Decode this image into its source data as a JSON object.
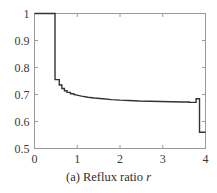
{
  "caption": {
    "prefix": "(a) Reflux ratio",
    "variable": "r"
  },
  "chart_data": {
    "type": "line",
    "title": "",
    "subtitle": "",
    "xlabel": "Reflux ratio r",
    "ylabel": "",
    "xlim": [
      0,
      4
    ],
    "ylim": [
      0.5,
      1.0
    ],
    "grid": false,
    "legend": false,
    "xticks": [
      0,
      1,
      2,
      3,
      4
    ],
    "xtick_labels": [
      "0",
      "1",
      "2",
      "3",
      "4"
    ],
    "yticks": [
      0.5,
      0.6,
      0.7,
      0.8,
      0.9,
      1.0
    ],
    "ytick_labels": [
      "0.5",
      "0.6",
      "0.7",
      "0.8",
      "0.9",
      "1"
    ],
    "line_color": "#333333",
    "frame_color": "#9a9a9a",
    "series": [
      {
        "name": "objective",
        "step_style": "post",
        "x": [
          0.0,
          0.48,
          0.48,
          0.58,
          0.58,
          0.64,
          0.64,
          0.7,
          0.7,
          0.76,
          0.76,
          0.84,
          0.84,
          0.92,
          0.92,
          1.02,
          1.1,
          1.25,
          1.4,
          1.6,
          1.8,
          2.0,
          2.2,
          2.45,
          2.7,
          2.95,
          3.2,
          3.45,
          3.62,
          3.62,
          3.78,
          3.78,
          3.86,
          3.86,
          3.94,
          4.0
        ],
        "y": [
          1.0,
          1.0,
          0.755,
          0.755,
          0.735,
          0.735,
          0.722,
          0.722,
          0.714,
          0.714,
          0.708,
          0.708,
          0.703,
          0.703,
          0.7,
          0.697,
          0.694,
          0.69,
          0.687,
          0.684,
          0.681,
          0.679,
          0.678,
          0.676,
          0.675,
          0.674,
          0.673,
          0.672,
          0.672,
          0.671,
          0.671,
          0.684,
          0.684,
          0.56,
          0.56,
          0.56
        ]
      }
    ],
    "annotations": [
      {
        "label": "initial plateau",
        "value": 1.0,
        "x_range": [
          0,
          0.48
        ]
      },
      {
        "label": "drop",
        "value": 0.755,
        "x": 0.48
      },
      {
        "label": "right plateau",
        "value": 0.671,
        "x": 3.6
      },
      {
        "label": "final value",
        "value": 0.56,
        "x": 4.0
      }
    ]
  }
}
